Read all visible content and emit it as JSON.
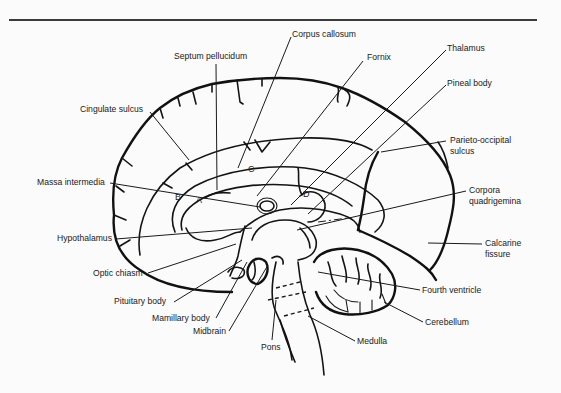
{
  "figure": {
    "rule_color": "#3a3a3a",
    "ink_color": "#141414",
    "background": "#fbfbfb"
  },
  "labels": {
    "corpus_callosum": "Corpus callosum",
    "septum_pellucidum": "Septum pellucidum",
    "fornix": "Fornix",
    "thalamus": "Thalamus",
    "pineal_body": "Pineal body",
    "cingulate_sulcus": "Cingulate sulcus",
    "parieto_occipital_line1": "Parieto-occipital",
    "parieto_occipital_line2": "sulcus",
    "massa_intermedia": "Massa intermedia",
    "corpora_line1": "Corpora",
    "corpora_line2": "quadrigemina",
    "hypothalamus": "Hypothalamus",
    "calcarine_line1": "Calcarine",
    "calcarine_line2": "fissure",
    "optic_chiasm": "Optic chiasm",
    "pituitary_body": "Pituitary body",
    "fourth_ventricle": "Fourth ventricle",
    "mamillary_body": "Mamillary body",
    "cerebellum": "Cerebellum",
    "midbrain": "Midbrain",
    "pons": "Pons",
    "medulla": "Medulla"
  },
  "region_letters": {
    "a": "A",
    "b": "B",
    "c": "C",
    "d": "D"
  }
}
